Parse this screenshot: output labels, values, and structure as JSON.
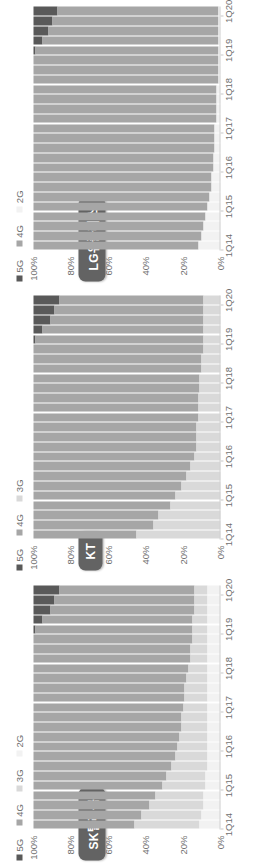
{
  "figure": {
    "orientation": "rotated-90-ccw",
    "background": "#ffffff",
    "panel_count": 3
  },
  "palette": {
    "5G": "#595959",
    "4G": "#a6a6a6",
    "3G": "#d9d9d9",
    "2G": "#f2f2f2",
    "title_badge_bg": "#636363",
    "title_badge_text": "#ffffff",
    "axis_text": "#6f6f6f",
    "axis_line": "#d2d2d2"
  },
  "axis": {
    "y_ticks": [
      "100%",
      "80%",
      "60%",
      "40%",
      "20%",
      "0%"
    ],
    "y_values": [
      100,
      80,
      60,
      40,
      20,
      0
    ],
    "x_ticks": [
      "1Q14",
      "1Q15",
      "1Q16",
      "1Q17",
      "1Q18",
      "1Q19",
      "1Q20"
    ],
    "x_tick_positions": [
      0,
      4,
      8,
      12,
      16,
      20,
      24
    ]
  },
  "panels": [
    {
      "id": "lg-uplus",
      "title": "LG유플러스",
      "legend": [
        {
          "label": "5G",
          "color": "#595959"
        },
        {
          "label": "4G",
          "color": "#a6a6a6"
        },
        {
          "label": "2G",
          "color": "#f2f2f2"
        }
      ]
    },
    {
      "id": "kt",
      "title": "KT",
      "legend": [
        {
          "label": "5G",
          "color": "#595959"
        },
        {
          "label": "4G",
          "color": "#a6a6a6"
        },
        {
          "label": "3G",
          "color": "#d9d9d9"
        }
      ]
    },
    {
      "id": "sk-telecom",
      "title": "SK텔레콤",
      "legend": [
        {
          "label": "5G",
          "color": "#595959"
        },
        {
          "label": "4G",
          "color": "#a6a6a6"
        },
        {
          "label": "3G",
          "color": "#d9d9d9"
        },
        {
          "label": "2G",
          "color": "#f2f2f2"
        }
      ]
    }
  ],
  "chart_data": [
    {
      "type": "bar",
      "stacked": true,
      "normalized": true,
      "title": "LG유플러스",
      "xlabel": "",
      "ylabel": "",
      "ylim": [
        0,
        100
      ],
      "grid": false,
      "legend_position": "top-right",
      "categories": [
        "1Q14",
        "2Q14",
        "3Q14",
        "4Q14",
        "1Q15",
        "2Q15",
        "3Q15",
        "4Q15",
        "1Q16",
        "2Q16",
        "3Q16",
        "4Q16",
        "1Q17",
        "2Q17",
        "3Q17",
        "4Q17",
        "1Q18",
        "2Q18",
        "3Q18",
        "4Q18",
        "1Q19",
        "2Q19",
        "3Q19",
        "4Q19",
        "1Q20"
      ],
      "series": [
        {
          "name": "5G",
          "color": "#595959",
          "values": [
            0,
            0,
            0,
            0,
            0,
            0,
            0,
            0,
            0,
            0,
            0,
            0,
            0,
            0,
            0,
            0,
            0,
            0,
            0,
            0,
            1,
            5,
            8,
            10,
            13
          ]
        },
        {
          "name": "4G",
          "color": "#a6a6a6",
          "values": [
            88,
            90,
            91,
            92,
            93,
            94,
            95,
            95,
            96,
            96,
            97,
            97,
            97,
            98,
            98,
            98,
            98,
            99,
            99,
            99,
            98,
            94,
            91,
            89,
            86
          ]
        },
        {
          "name": "2G",
          "color": "#f2f2f2",
          "values": [
            12,
            10,
            9,
            8,
            7,
            6,
            5,
            5,
            4,
            4,
            3,
            3,
            3,
            2,
            2,
            2,
            2,
            1,
            1,
            1,
            1,
            1,
            1,
            1,
            1
          ]
        }
      ]
    },
    {
      "type": "bar",
      "stacked": true,
      "normalized": true,
      "title": "KT",
      "xlabel": "",
      "ylabel": "",
      "ylim": [
        0,
        100
      ],
      "grid": false,
      "legend_position": "top-right",
      "categories": [
        "1Q14",
        "2Q14",
        "3Q14",
        "4Q14",
        "1Q15",
        "2Q15",
        "3Q15",
        "4Q15",
        "1Q16",
        "2Q16",
        "3Q16",
        "4Q16",
        "1Q17",
        "2Q17",
        "3Q17",
        "4Q17",
        "1Q18",
        "2Q18",
        "3Q18",
        "4Q18",
        "1Q19",
        "2Q19",
        "3Q19",
        "4Q19",
        "1Q20"
      ],
      "series": [
        {
          "name": "5G",
          "color": "#595959",
          "values": [
            0,
            0,
            0,
            0,
            0,
            0,
            0,
            0,
            0,
            0,
            0,
            0,
            0,
            0,
            0,
            0,
            0,
            0,
            0,
            0,
            1,
            5,
            9,
            11,
            14
          ]
        },
        {
          "name": "4G",
          "color": "#a6a6a6",
          "values": [
            55,
            64,
            67,
            73,
            76,
            79,
            82,
            84,
            86,
            87,
            87,
            87,
            88,
            88,
            88,
            89,
            89,
            90,
            90,
            91,
            90,
            86,
            82,
            80,
            77
          ]
        },
        {
          "name": "3G",
          "color": "#d9d9d9",
          "values": [
            45,
            36,
            33,
            27,
            24,
            21,
            18,
            16,
            14,
            13,
            13,
            13,
            12,
            12,
            12,
            11,
            11,
            10,
            10,
            9,
            9,
            9,
            9,
            9,
            9
          ]
        }
      ]
    },
    {
      "type": "bar",
      "stacked": true,
      "normalized": true,
      "title": "SK텔레콤",
      "xlabel": "",
      "ylabel": "",
      "ylim": [
        0,
        100
      ],
      "grid": false,
      "legend_position": "top-right",
      "categories": [
        "1Q14",
        "2Q14",
        "3Q14",
        "4Q14",
        "1Q15",
        "2Q15",
        "3Q15",
        "4Q15",
        "1Q16",
        "2Q16",
        "3Q16",
        "4Q16",
        "1Q17",
        "2Q17",
        "3Q17",
        "4Q17",
        "1Q18",
        "2Q18",
        "3Q18",
        "4Q18",
        "1Q19",
        "2Q19",
        "3Q19",
        "4Q19",
        "1Q20"
      ],
      "series": [
        {
          "name": "5G",
          "color": "#595959",
          "values": [
            0,
            0,
            0,
            0,
            0,
            0,
            0,
            0,
            0,
            0,
            0,
            0,
            0,
            0,
            0,
            0,
            0,
            0,
            0,
            0,
            1,
            5,
            9,
            11,
            14
          ]
        },
        {
          "name": "4G",
          "color": "#a6a6a6",
          "values": [
            54,
            58,
            62,
            65,
            69,
            71,
            74,
            76,
            77,
            78,
            79,
            79,
            80,
            81,
            81,
            82,
            83,
            84,
            84,
            85,
            84,
            80,
            77,
            75,
            72
          ]
        },
        {
          "name": "3G",
          "color": "#d9d9d9",
          "values": [
            35,
            32,
            29,
            26,
            23,
            21,
            19,
            17,
            16,
            15,
            14,
            14,
            13,
            12,
            12,
            11,
            10,
            9,
            9,
            8,
            8,
            8,
            7,
            7,
            7
          ]
        },
        {
          "name": "2G",
          "color": "#f2f2f2",
          "values": [
            11,
            10,
            9,
            9,
            8,
            8,
            7,
            7,
            7,
            7,
            7,
            7,
            7,
            7,
            7,
            7,
            7,
            7,
            7,
            7,
            7,
            7,
            7,
            7,
            7
          ]
        }
      ]
    }
  ]
}
